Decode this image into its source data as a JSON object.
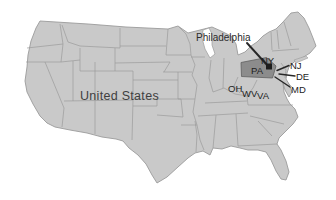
{
  "figure": {
    "type": "country-map",
    "country": "United States",
    "highlighted_state": "PA",
    "marked_city": "Philadelphia"
  },
  "labels": {
    "country": "United States",
    "city": "Philadelphia",
    "ny": "NY",
    "pa": "PA",
    "nj": "NJ",
    "de": "DE",
    "md": "MD",
    "oh": "OH",
    "wv": "WV",
    "va": "VA"
  },
  "colors": {
    "background": "#ffffff",
    "state_fill": "#c9c9c9",
    "state_border": "#9b9b9b",
    "highlight_fill": "#8c8c8c",
    "highlight_border": "#5f5f5f",
    "marker": "#1c1c1c",
    "leader_line": "#262626",
    "state_label_text": "#1d1d1d",
    "country_label_text": "#3f3f3f"
  }
}
